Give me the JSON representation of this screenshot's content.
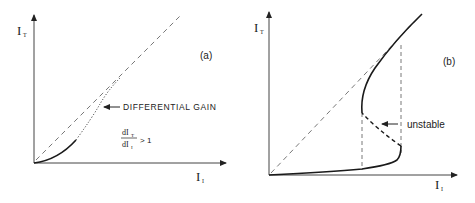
{
  "panel_a": {
    "tag": "(a)",
    "y_axis_label": "I",
    "y_axis_sub": "T",
    "x_axis_label": "I",
    "x_axis_sub": "I",
    "annotation": "DIFFERENTIAL GAIN",
    "formula_num": "dI",
    "formula_num_sub": "T",
    "formula_den": "dI",
    "formula_den_sub": "I",
    "formula_rel": "> 1"
  },
  "panel_b": {
    "tag": "(b)",
    "y_axis_label": "I",
    "y_axis_sub": "T",
    "x_axis_label": "I",
    "x_axis_sub": "I",
    "annotation": "unstable"
  },
  "colors": {
    "line": "#1a1a1a",
    "dashed": "#555555",
    "axis": "#444444"
  }
}
